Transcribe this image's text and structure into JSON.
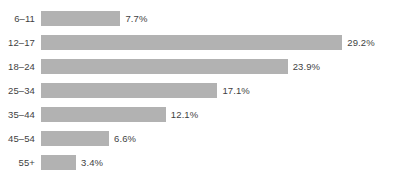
{
  "chart_data": {
    "type": "bar",
    "orientation": "horizontal",
    "title": "",
    "subtitle": "",
    "xlabel": "",
    "ylabel": "",
    "grid": false,
    "legend": null,
    "axis_visible": false,
    "tick_labels_visible": false,
    "value_labels_visible": true,
    "xlim": [
      0,
      29.2
    ],
    "categories": [
      "6–11",
      "12–17",
      "18–24",
      "25–34",
      "35–44",
      "45–54",
      "55+"
    ],
    "values": [
      7.7,
      29.2,
      23.9,
      17.1,
      12.1,
      6.6,
      3.4
    ],
    "value_label_suffix": "%",
    "value_labels": [
      "7.7%",
      "29.2%",
      "23.9%",
      "17.1%",
      "12.1%",
      "6.6%",
      "3.4%"
    ],
    "bars": [
      {
        "category": "6–11",
        "value": 7.7,
        "label": "7.7%"
      },
      {
        "category": "12–17",
        "value": 29.2,
        "label": "29.2%"
      },
      {
        "category": "18–24",
        "value": 23.9,
        "label": "23.9%"
      },
      {
        "category": "25–34",
        "value": 17.1,
        "label": "17.1%"
      },
      {
        "category": "35–44",
        "value": 12.1,
        "label": "12.1%"
      },
      {
        "category": "45–54",
        "value": 6.6,
        "label": "6.6%"
      },
      {
        "category": "55+",
        "value": 3.4,
        "label": "3.4%"
      }
    ]
  },
  "colors": {
    "background": "#ffffff",
    "bar_fill": "#b2b2b2",
    "text": "#3f3f3f"
  }
}
